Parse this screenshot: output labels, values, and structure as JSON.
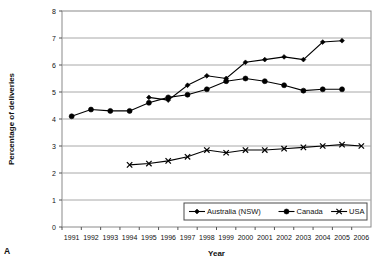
{
  "panel": {
    "label": "A"
  },
  "chart_data": {
    "type": "line",
    "title": "",
    "xlabel": "Year",
    "ylabel": "Percentage of deliveries",
    "xlim": [
      1991,
      2006
    ],
    "ylim": [
      0,
      8
    ],
    "ytick_step": 1,
    "grid": true,
    "legend_position": "bottom-right",
    "categories": [
      1991,
      1992,
      1993,
      1994,
      1995,
      1996,
      1997,
      1998,
      1999,
      2000,
      2001,
      2002,
      2003,
      2004,
      2005,
      2006
    ],
    "xtick_labels": [
      "1991",
      "1992",
      "1993",
      "1994",
      "1995",
      "1996",
      "1997",
      "1998",
      "1999",
      "2000",
      "2001",
      "2002",
      "2003",
      "2004",
      "2005",
      "2006"
    ],
    "ytick_labels": [
      "0",
      "1",
      "2",
      "3",
      "4",
      "5",
      "6",
      "7",
      "8"
    ],
    "series": [
      {
        "name": "Australia (NSW)",
        "marker": "diamond",
        "color": "#000000",
        "x": [
          1995,
          1996,
          1997,
          1998,
          1999,
          2000,
          2001,
          2002,
          2003,
          2004,
          2005
        ],
        "values": [
          4.8,
          4.7,
          5.25,
          5.6,
          5.5,
          6.1,
          6.2,
          6.3,
          6.2,
          6.85,
          6.9
        ]
      },
      {
        "name": "Canada",
        "marker": "circle",
        "color": "#000000",
        "x": [
          1991,
          1992,
          1993,
          1994,
          1995,
          1996,
          1997,
          1998,
          1999,
          2000,
          2001,
          2002,
          2003,
          2004,
          2005
        ],
        "values": [
          4.1,
          4.35,
          4.3,
          4.3,
          4.6,
          4.8,
          4.9,
          5.1,
          5.4,
          5.5,
          5.4,
          5.25,
          5.05,
          5.1,
          5.1
        ]
      },
      {
        "name": "USA",
        "marker": "cross",
        "color": "#000000",
        "x": [
          1994,
          1995,
          1996,
          1997,
          1998,
          1999,
          2000,
          2001,
          2002,
          2003,
          2004,
          2005,
          2006
        ],
        "values": [
          2.3,
          2.35,
          2.45,
          2.6,
          2.85,
          2.75,
          2.85,
          2.85,
          2.9,
          2.95,
          3.0,
          3.05,
          3.0
        ]
      }
    ]
  }
}
